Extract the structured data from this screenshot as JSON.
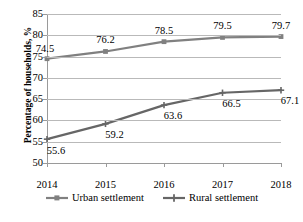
{
  "chart_data": {
    "type": "line",
    "title": "",
    "xlabel": "",
    "ylabel": "Percentage of households, %",
    "categories": [
      "2014",
      "2015",
      "2016",
      "2017",
      "2018"
    ],
    "x": [
      2014,
      2015,
      2016,
      2017,
      2018
    ],
    "ylim": [
      50,
      85
    ],
    "y_ticks": [
      "50",
      "55",
      "60",
      "65",
      "70",
      "75",
      "80",
      "85"
    ],
    "grid": true,
    "legend_position": "bottom",
    "series": [
      {
        "name": "Urban settlement",
        "marker": "square",
        "color": "#808080",
        "values": [
          74.5,
          76.2,
          78.5,
          79.5,
          79.7
        ],
        "labels": [
          "74.5",
          "76.2",
          "78.5",
          "79.5",
          "79.7"
        ],
        "label_positions": [
          "below-left",
          "above",
          "above",
          "above",
          "above"
        ]
      },
      {
        "name": "Rural settlement",
        "marker": "plus",
        "color": "#666666",
        "values": [
          55.6,
          59.2,
          63.6,
          66.5,
          67.1
        ],
        "labels": [
          "55.6",
          "59.2",
          "63.6",
          "66.5",
          "67.1"
        ],
        "label_positions": [
          "below",
          "below",
          "below",
          "below",
          "below"
        ]
      }
    ]
  },
  "legend": {
    "items": [
      {
        "label": "Urban settlement",
        "marker": "square-marker-icon"
      },
      {
        "label": "Rural settlement",
        "marker": "plus-marker-icon"
      }
    ]
  },
  "colors": {
    "series_urban": "#808080",
    "series_rural": "#666666",
    "gridline": "#b9b9b9",
    "axis": "#9a9a9a",
    "text": "#000000",
    "background": "#ffffff"
  }
}
